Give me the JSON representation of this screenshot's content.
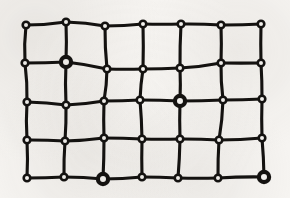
{
  "figure": {
    "type": "node-link-lattice",
    "canvas": {
      "width": 290,
      "height": 198
    },
    "style": {
      "background_color": "#f6f4f1",
      "ink_color": "#141210",
      "node_fill_color": "#f6f4f1",
      "edge_width": 3.1,
      "node_small_outer_radius": 4.6,
      "node_small_inner_radius": 2.0,
      "node_large_outer_radius": 7.2,
      "node_large_inner_radius": 3.0,
      "node_stroke_width": 2.6
    },
    "grid": {
      "columns": 7,
      "rows": 5,
      "node_count": 35,
      "edge_count": 58
    },
    "marked_node_ids": [
      "r1c1",
      "r2c4",
      "r4c2",
      "r4c6"
    ],
    "nodes": [
      {
        "id": "r0c0",
        "row": 0,
        "col": 0,
        "x": 26,
        "y": 25,
        "size": "small"
      },
      {
        "id": "r0c1",
        "row": 0,
        "col": 1,
        "x": 66,
        "y": 22,
        "size": "small"
      },
      {
        "id": "r0c2",
        "row": 0,
        "col": 2,
        "x": 105,
        "y": 26,
        "size": "small"
      },
      {
        "id": "r0c3",
        "row": 0,
        "col": 3,
        "x": 143,
        "y": 24,
        "size": "small"
      },
      {
        "id": "r0c4",
        "row": 0,
        "col": 4,
        "x": 181,
        "y": 24,
        "size": "small"
      },
      {
        "id": "r0c5",
        "row": 0,
        "col": 5,
        "x": 221,
        "y": 25,
        "size": "small"
      },
      {
        "id": "r0c6",
        "row": 0,
        "col": 6,
        "x": 261,
        "y": 24,
        "size": "small"
      },
      {
        "id": "r1c0",
        "row": 1,
        "col": 0,
        "x": 25,
        "y": 63,
        "size": "small"
      },
      {
        "id": "r1c1",
        "row": 1,
        "col": 1,
        "x": 66,
        "y": 62,
        "size": "large"
      },
      {
        "id": "r1c2",
        "row": 1,
        "col": 2,
        "x": 107,
        "y": 69,
        "size": "small"
      },
      {
        "id": "r1c3",
        "row": 1,
        "col": 3,
        "x": 143,
        "y": 69,
        "size": "small"
      },
      {
        "id": "r1c4",
        "row": 1,
        "col": 4,
        "x": 180,
        "y": 68,
        "size": "small"
      },
      {
        "id": "r1c5",
        "row": 1,
        "col": 5,
        "x": 221,
        "y": 63,
        "size": "small"
      },
      {
        "id": "r1c6",
        "row": 1,
        "col": 6,
        "x": 261,
        "y": 63,
        "size": "small"
      },
      {
        "id": "r2c0",
        "row": 2,
        "col": 0,
        "x": 27,
        "y": 102,
        "size": "small"
      },
      {
        "id": "r2c1",
        "row": 2,
        "col": 1,
        "x": 66,
        "y": 105,
        "size": "small"
      },
      {
        "id": "r2c2",
        "row": 2,
        "col": 2,
        "x": 104,
        "y": 101,
        "size": "small"
      },
      {
        "id": "r2c3",
        "row": 2,
        "col": 3,
        "x": 140,
        "y": 100,
        "size": "small"
      },
      {
        "id": "r2c4",
        "row": 2,
        "col": 4,
        "x": 180,
        "y": 101,
        "size": "large"
      },
      {
        "id": "r2c5",
        "row": 2,
        "col": 5,
        "x": 223,
        "y": 100,
        "size": "small"
      },
      {
        "id": "r2c6",
        "row": 2,
        "col": 6,
        "x": 262,
        "y": 99,
        "size": "small"
      },
      {
        "id": "r3c0",
        "row": 3,
        "col": 0,
        "x": 27,
        "y": 140,
        "size": "small"
      },
      {
        "id": "r3c1",
        "row": 3,
        "col": 1,
        "x": 65,
        "y": 141,
        "size": "small"
      },
      {
        "id": "r3c2",
        "row": 3,
        "col": 2,
        "x": 104,
        "y": 138,
        "size": "small"
      },
      {
        "id": "r3c3",
        "row": 3,
        "col": 3,
        "x": 142,
        "y": 139,
        "size": "small"
      },
      {
        "id": "r3c4",
        "row": 3,
        "col": 4,
        "x": 180,
        "y": 139,
        "size": "small"
      },
      {
        "id": "r3c5",
        "row": 3,
        "col": 5,
        "x": 219,
        "y": 140,
        "size": "small"
      },
      {
        "id": "r3c6",
        "row": 3,
        "col": 6,
        "x": 262,
        "y": 138,
        "size": "small"
      },
      {
        "id": "r4c0",
        "row": 4,
        "col": 0,
        "x": 27,
        "y": 178,
        "size": "small"
      },
      {
        "id": "r4c1",
        "row": 4,
        "col": 1,
        "x": 64,
        "y": 177,
        "size": "small"
      },
      {
        "id": "r4c2",
        "row": 4,
        "col": 2,
        "x": 103,
        "y": 179,
        "size": "large"
      },
      {
        "id": "r4c3",
        "row": 4,
        "col": 3,
        "x": 142,
        "y": 177,
        "size": "small"
      },
      {
        "id": "r4c4",
        "row": 4,
        "col": 4,
        "x": 178,
        "y": 178,
        "size": "small"
      },
      {
        "id": "r4c5",
        "row": 4,
        "col": 5,
        "x": 218,
        "y": 178,
        "size": "small"
      },
      {
        "id": "r4c6",
        "row": 4,
        "col": 6,
        "x": 264,
        "y": 177,
        "size": "large"
      }
    ],
    "edges": [
      {
        "from": "r0c0",
        "to": "r0c1",
        "bow": 1.5
      },
      {
        "from": "r0c1",
        "to": "r0c2",
        "bow": -1.5
      },
      {
        "from": "r0c2",
        "to": "r0c3",
        "bow": 0.8
      },
      {
        "from": "r0c3",
        "to": "r0c4",
        "bow": 0.5
      },
      {
        "from": "r0c4",
        "to": "r0c5",
        "bow": -0.8
      },
      {
        "from": "r0c5",
        "to": "r0c6",
        "bow": 0.6
      },
      {
        "from": "r1c0",
        "to": "r1c1",
        "bow": 0.5
      },
      {
        "from": "r1c1",
        "to": "r1c2",
        "bow": -1.2
      },
      {
        "from": "r1c2",
        "to": "r1c3",
        "bow": 0.4
      },
      {
        "from": "r1c3",
        "to": "r1c4",
        "bow": 0.4
      },
      {
        "from": "r1c4",
        "to": "r1c5",
        "bow": 1.4
      },
      {
        "from": "r1c5",
        "to": "r1c6",
        "bow": 0.3
      },
      {
        "from": "r2c0",
        "to": "r2c1",
        "bow": -1.0
      },
      {
        "from": "r2c1",
        "to": "r2c2",
        "bow": 1.2
      },
      {
        "from": "r2c2",
        "to": "r2c3",
        "bow": 0.4
      },
      {
        "from": "r2c3",
        "to": "r2c4",
        "bow": -0.4
      },
      {
        "from": "r2c4",
        "to": "r2c5",
        "bow": 0.4
      },
      {
        "from": "r2c5",
        "to": "r2c6",
        "bow": 0.4
      },
      {
        "from": "r3c0",
        "to": "r3c1",
        "bow": -0.6
      },
      {
        "from": "r3c1",
        "to": "r3c2",
        "bow": 1.0
      },
      {
        "from": "r3c2",
        "to": "r3c3",
        "bow": -0.5
      },
      {
        "from": "r3c3",
        "to": "r3c4",
        "bow": 0.4
      },
      {
        "from": "r3c4",
        "to": "r3c5",
        "bow": -0.6
      },
      {
        "from": "r3c5",
        "to": "r3c6",
        "bow": 0.8
      },
      {
        "from": "r4c0",
        "to": "r4c1",
        "bow": 0.5
      },
      {
        "from": "r4c1",
        "to": "r4c2",
        "bow": -0.9
      },
      {
        "from": "r4c2",
        "to": "r4c3",
        "bow": 0.8
      },
      {
        "from": "r4c3",
        "to": "r4c4",
        "bow": -0.5
      },
      {
        "from": "r4c4",
        "to": "r4c5",
        "bow": 0.4
      },
      {
        "from": "r4c5",
        "to": "r4c6",
        "bow": -0.9
      },
      {
        "from": "r0c0",
        "to": "r1c0",
        "bow": 1.6
      },
      {
        "from": "r1c0",
        "to": "r2c0",
        "bow": -1.4
      },
      {
        "from": "r2c0",
        "to": "r3c0",
        "bow": 1.2
      },
      {
        "from": "r3c0",
        "to": "r4c0",
        "bow": -1.0
      },
      {
        "from": "r0c1",
        "to": "r1c1",
        "bow": -0.8
      },
      {
        "from": "r1c1",
        "to": "r2c1",
        "bow": 1.0
      },
      {
        "from": "r2c1",
        "to": "r3c1",
        "bow": -0.8
      },
      {
        "from": "r3c1",
        "to": "r4c1",
        "bow": 0.8
      },
      {
        "from": "r0c2",
        "to": "r1c2",
        "bow": 1.2
      },
      {
        "from": "r1c2",
        "to": "r2c2",
        "bow": -1.3
      },
      {
        "from": "r2c2",
        "to": "r3c2",
        "bow": 0.6
      },
      {
        "from": "r3c2",
        "to": "r4c2",
        "bow": -0.5
      },
      {
        "from": "r0c3",
        "to": "r1c3",
        "bow": -0.6
      },
      {
        "from": "r1c3",
        "to": "r2c3",
        "bow": 0.9
      },
      {
        "from": "r2c3",
        "to": "r3c3",
        "bow": -0.7
      },
      {
        "from": "r3c3",
        "to": "r4c3",
        "bow": 0.5
      },
      {
        "from": "r0c4",
        "to": "r1c4",
        "bow": 0.7
      },
      {
        "from": "r1c4",
        "to": "r2c4",
        "bow": -0.7
      },
      {
        "from": "r2c4",
        "to": "r3c4",
        "bow": 0.6
      },
      {
        "from": "r3c4",
        "to": "r4c4",
        "bow": -0.6
      },
      {
        "from": "r0c5",
        "to": "r1c5",
        "bow": -0.7
      },
      {
        "from": "r1c5",
        "to": "r2c5",
        "bow": 1.3
      },
      {
        "from": "r2c5",
        "to": "r3c5",
        "bow": -1.4
      },
      {
        "from": "r3c5",
        "to": "r4c5",
        "bow": 0.7
      },
      {
        "from": "r0c6",
        "to": "r1c6",
        "bow": 0.5
      },
      {
        "from": "r1c6",
        "to": "r2c6",
        "bow": -0.6
      },
      {
        "from": "r2c6",
        "to": "r3c6",
        "bow": 0.6
      },
      {
        "from": "r3c6",
        "to": "r4c6",
        "bow": -0.7
      }
    ]
  }
}
